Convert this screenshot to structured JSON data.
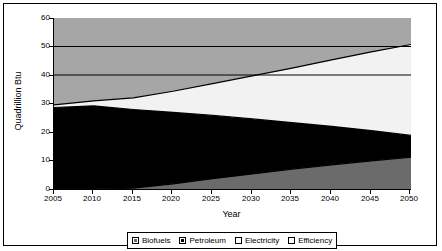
{
  "chart_data": {
    "type": "area",
    "stacked": true,
    "title": "",
    "xlabel": "Year",
    "ylabel": "Quadrillion Btu",
    "xlim": [
      2005,
      2050
    ],
    "ylim": [
      0,
      60
    ],
    "ytick_values": [
      0,
      10,
      20,
      30,
      40,
      50,
      60
    ],
    "ytick_labels": [
      "0",
      "10",
      "20",
      "30",
      "40",
      "50",
      "60"
    ],
    "xtick_values": [
      2005,
      2010,
      2015,
      2020,
      2025,
      2030,
      2035,
      2040,
      2045,
      2050
    ],
    "xtick_labels": [
      "2005",
      "2010",
      "2015",
      "2020",
      "2025",
      "2030",
      "2035",
      "2040",
      "2045",
      "2050"
    ],
    "grid": false,
    "legend_position": "bottom",
    "x": [
      2005,
      2010,
      2015,
      2020,
      2025,
      2030,
      2035,
      2040,
      2045,
      2050
    ],
    "series": [
      {
        "name": "Biofuels",
        "color": "#6b6b6b",
        "values": [
          0.0,
          0.0,
          0.3,
          1.8,
          3.6,
          5.3,
          7.0,
          8.5,
          9.9,
          11.2
        ]
      },
      {
        "name": "Petroleum",
        "color": "#000000",
        "values": [
          28.6,
          29.2,
          27.6,
          25.1,
          22.2,
          19.3,
          16.3,
          13.5,
          10.6,
          7.6
        ]
      },
      {
        "name": "Electricity",
        "color": "#f2f2f2",
        "values": [
          0.9,
          1.7,
          4.1,
          7.4,
          11.2,
          15.1,
          19.1,
          23.3,
          27.6,
          31.9
        ]
      },
      {
        "name": "Efficiency",
        "color": "#a6a6a6",
        "values": [
          30.5,
          29.1,
          28.0,
          25.7,
          23.0,
          20.3,
          17.6,
          14.7,
          11.9,
          9.3
        ]
      }
    ],
    "series_cumulative_tops": {
      "biofuels": [
        0.0,
        0.0,
        0.3,
        1.8,
        3.6,
        5.3,
        7.0,
        8.5,
        9.9,
        11.2
      ],
      "petroleum": [
        28.6,
        29.2,
        27.9,
        26.9,
        25.8,
        24.6,
        23.3,
        22.0,
        20.5,
        18.8
      ],
      "electricity": [
        29.5,
        30.9,
        32.0,
        34.3,
        37.0,
        39.7,
        42.4,
        45.3,
        48.1,
        50.7
      ],
      "efficiency": [
        60.0,
        60.0,
        60.0,
        60.0,
        60.0,
        60.0,
        60.0,
        60.0,
        60.0,
        60.0
      ]
    }
  },
  "axes": {
    "ylabel": "Quadrillion Btu",
    "xlabel": "Year",
    "ytick_labels": [
      "60",
      "50",
      "40",
      "30",
      "20",
      "10",
      "0"
    ],
    "xtick_labels": [
      "2005",
      "2010",
      "2015",
      "2020",
      "2025",
      "2030",
      "2035",
      "2040",
      "2045",
      "2050"
    ]
  },
  "legend": {
    "items": [
      {
        "label": "Biofuels",
        "color": "#6b6b6b"
      },
      {
        "label": "Petroleum",
        "color": "#000000"
      },
      {
        "label": "Electricity",
        "color": "#fbfbfb"
      },
      {
        "label": "Efficiency",
        "color": "#fbfbfb"
      }
    ]
  }
}
